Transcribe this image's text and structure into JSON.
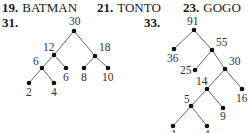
{
  "answers": [
    {
      "number": "19.",
      "text": "BATMAN"
    },
    {
      "number": "21.",
      "text": "TONTO"
    },
    {
      "number": "23.",
      "text": "GOGO"
    }
  ],
  "figures": [
    {
      "number": "31.",
      "type": "tree",
      "nodes": [
        {
          "id": "a",
          "label": "30",
          "x": 74,
          "y": 31,
          "lx": 69,
          "ly": 25
        },
        {
          "id": "b",
          "label": "12",
          "x": 54,
          "y": 55,
          "lx": 43,
          "ly": 51
        },
        {
          "id": "c",
          "label": "18",
          "x": 95,
          "y": 56,
          "lx": 99,
          "ly": 51
        },
        {
          "id": "d",
          "label": "6",
          "x": 42,
          "y": 68,
          "lx": 33,
          "ly": 65
        },
        {
          "id": "e",
          "label": "6",
          "x": 66,
          "y": 68,
          "lx": 63,
          "ly": 81
        },
        {
          "id": "f",
          "label": "8",
          "x": 84,
          "y": 68,
          "lx": 81,
          "ly": 81
        },
        {
          "id": "g",
          "label": "10",
          "x": 108,
          "y": 68,
          "lx": 102,
          "ly": 81
        },
        {
          "id": "h",
          "label": "2",
          "x": 29,
          "y": 83,
          "lx": 26,
          "ly": 96
        },
        {
          "id": "i",
          "label": "4",
          "x": 54,
          "y": 83,
          "lx": 51,
          "ly": 96
        }
      ],
      "edges": [
        [
          "a",
          "b"
        ],
        [
          "a",
          "c"
        ],
        [
          "b",
          "d"
        ],
        [
          "b",
          "e"
        ],
        [
          "c",
          "f"
        ],
        [
          "c",
          "g"
        ],
        [
          "d",
          "h"
        ],
        [
          "d",
          "i"
        ]
      ]
    },
    {
      "number": "33.",
      "type": "tree",
      "nodes": [
        {
          "id": "a",
          "label": "91",
          "x": 194,
          "y": 30,
          "lx": 187,
          "ly": 25
        },
        {
          "id": "b",
          "label": "36",
          "x": 174,
          "y": 49,
          "lx": 167,
          "ly": 62
        },
        {
          "id": "c",
          "label": "55",
          "x": 212,
          "y": 50,
          "lx": 216,
          "ly": 46
        },
        {
          "id": "d",
          "label": "25",
          "x": 195,
          "y": 70,
          "lx": 180,
          "ly": 74
        },
        {
          "id": "e",
          "label": "30",
          "x": 225,
          "y": 69,
          "lx": 229,
          "ly": 65
        },
        {
          "id": "f",
          "label": "14",
          "x": 207,
          "y": 89,
          "lx": 196,
          "ly": 85
        },
        {
          "id": "g",
          "label": "16",
          "x": 242,
          "y": 89,
          "lx": 236,
          "ly": 102
        },
        {
          "id": "h",
          "label": "5",
          "x": 191,
          "y": 106,
          "lx": 184,
          "ly": 103
        },
        {
          "id": "i",
          "label": "9",
          "x": 223,
          "y": 108,
          "lx": 220,
          "ly": 120
        },
        {
          "id": "j",
          "label": "1",
          "x": 173,
          "y": 126,
          "lx": 171,
          "ly": 138
        },
        {
          "id": "k",
          "label": "4",
          "x": 207,
          "y": 126,
          "lx": 204,
          "ly": 138
        }
      ],
      "edges": [
        [
          "a",
          "b"
        ],
        [
          "a",
          "c"
        ],
        [
          "c",
          "d"
        ],
        [
          "c",
          "e"
        ],
        [
          "e",
          "f"
        ],
        [
          "e",
          "g"
        ],
        [
          "f",
          "h"
        ],
        [
          "f",
          "i"
        ],
        [
          "h",
          "j"
        ],
        [
          "h",
          "k"
        ]
      ]
    }
  ]
}
